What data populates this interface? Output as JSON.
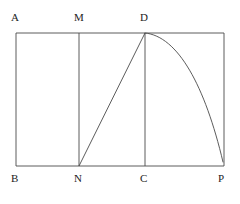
{
  "figure": {
    "type": "geometry-diagram",
    "background_color": "#ffffff",
    "stroke_color": "#444444",
    "label_color": "#1c1c1c",
    "stroke_width": 0.9,
    "vertices": {
      "A": {
        "label": "A",
        "x": 16,
        "y": 33
      },
      "B": {
        "label": "B",
        "x": 16,
        "y": 166
      },
      "M": {
        "label": "M",
        "x": 79,
        "y": 33
      },
      "N": {
        "label": "N",
        "x": 79,
        "y": 166
      },
      "D": {
        "label": "D",
        "x": 145,
        "y": 33
      },
      "C": {
        "label": "C",
        "x": 145,
        "y": 166
      },
      "P": {
        "label": "P",
        "x": 224,
        "y": 166
      }
    },
    "labels": [
      {
        "name": "label-A",
        "text": "A",
        "x": 11,
        "y": 12,
        "position": "above-left"
      },
      {
        "name": "label-M",
        "text": "M",
        "x": 74,
        "y": 12,
        "position": "above"
      },
      {
        "name": "label-D",
        "text": "D",
        "x": 140,
        "y": 12,
        "position": "above"
      },
      {
        "name": "label-B",
        "text": "B",
        "x": 11,
        "y": 173,
        "position": "below-left"
      },
      {
        "name": "label-N",
        "text": "N",
        "x": 74,
        "y": 173,
        "position": "below"
      },
      {
        "name": "label-C",
        "text": "C",
        "x": 140,
        "y": 173,
        "position": "below"
      },
      {
        "name": "label-P",
        "text": "P",
        "x": 218,
        "y": 173,
        "position": "below-right"
      }
    ],
    "edges": [
      {
        "name": "rectangle-outline",
        "points": "16,33 224,33 224,166 16,166",
        "closed": true
      },
      {
        "name": "segment-MN",
        "from": "M",
        "to": "N",
        "x1": 79,
        "y1": 33,
        "x2": 79,
        "y2": 166
      },
      {
        "name": "segment-DC",
        "from": "D",
        "to": "C",
        "x1": 145,
        "y1": 33,
        "x2": 145,
        "y2": 166
      },
      {
        "name": "segment-ND",
        "from": "N",
        "to": "D",
        "x1": 79,
        "y1": 166,
        "x2": 145,
        "y2": 33
      }
    ],
    "arc": {
      "name": "arc-DP",
      "from": "D",
      "to": "P",
      "path": "M 145 33 C 178 36 205 86 223 162",
      "curvature": "concave-toward-C"
    }
  }
}
